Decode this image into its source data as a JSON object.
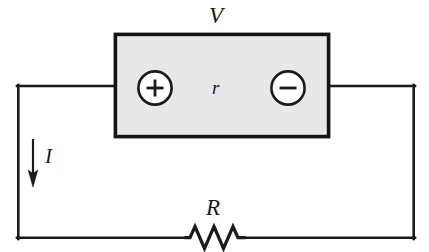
{
  "figure": {
    "kind": "electrical-circuit-schematic",
    "width": 429,
    "height": 252,
    "background_color": "#ffffff",
    "line_color": "#1a1a1a"
  },
  "battery": {
    "box_fill_color": "#e8e8e8",
    "box_border_color": "#141414",
    "terminal_label": "V",
    "internal_resistance_label": "r",
    "positive_terminal_symbol": "+",
    "negative_terminal_symbol": "−",
    "box": {
      "x": 114,
      "y": 33,
      "width": 216,
      "height": 105
    },
    "positive_terminal": {
      "cx": 155,
      "cy": 88,
      "r": 17
    },
    "negative_terminal": {
      "cx": 288,
      "cy": 88,
      "r": 17
    }
  },
  "circuit": {
    "loop": {
      "left": 17,
      "right": 415,
      "top": 86,
      "bottom": 238
    },
    "wire_width": 2.6
  },
  "current": {
    "label": "I",
    "arrow_direction": "down",
    "arrow": {
      "x": 33,
      "y_start": 139,
      "y_end": 186
    }
  },
  "resistor": {
    "label": "R",
    "zigzag_peaks": 3,
    "center_x": 215,
    "center_y": 238,
    "span": 58,
    "amplitude": 11
  },
  "labels": {
    "voltage": "V",
    "internal_resistance": "r",
    "current": "I",
    "resistance": "R"
  }
}
